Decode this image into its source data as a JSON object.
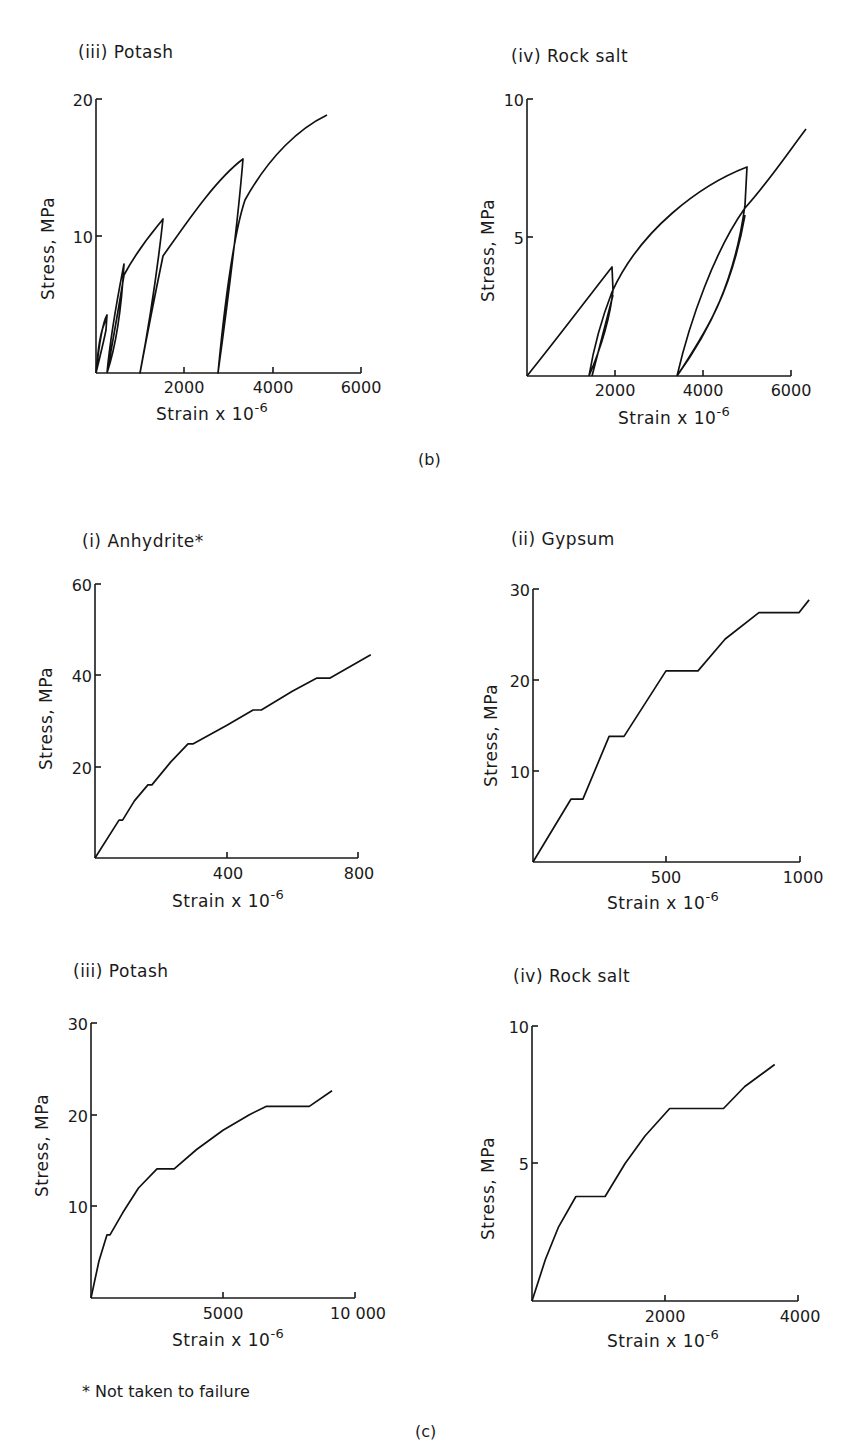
{
  "captions": {
    "b": "(b)",
    "c": "(c)"
  },
  "footnote": "* Not taken to failure",
  "axis_labels": {
    "y": "Stress, MPa",
    "x_prefix": "Strain x 10",
    "x_exp": "-6"
  },
  "chart_data": [
    {
      "id": "b-iii",
      "type": "line",
      "title": "(iii) Potash",
      "group": "(b)",
      "xlabel": "Strain x 10^-6",
      "ylabel": "Stress, MPa",
      "xlim": [
        0,
        6000
      ],
      "ylim": [
        0,
        20
      ],
      "xticks": [
        2000,
        4000,
        6000
      ],
      "yticks": [
        10,
        20
      ],
      "xticklabels": [
        "2000",
        "4000",
        "6000"
      ],
      "yticklabels": [
        "10",
        "20"
      ],
      "grid": false,
      "description": "Cyclic loading with hysteresis loops",
      "x": [
        0,
        120,
        250,
        180,
        60,
        0,
        260,
        450,
        630,
        560,
        260,
        600,
        1000,
        1520,
        1430,
        1010,
        1200,
        1600,
        2200,
        2800,
        3330,
        3250,
        2740,
        3000,
        3400,
        3800,
        4300,
        4800,
        5230
      ],
      "y": [
        0,
        2.5,
        4.2,
        3.0,
        1.0,
        0,
        0,
        4.5,
        8.0,
        6.5,
        0,
        5.0,
        7.8,
        11.2,
        9.5,
        0,
        5.0,
        9.2,
        12.0,
        14.0,
        15.6,
        12.8,
        0,
        7.0,
        13.0,
        15.8,
        17.3,
        18.2,
        18.8
      ],
      "peaks": [
        {
          "x": 250,
          "y": 4.2
        },
        {
          "x": 630,
          "y": 8.0
        },
        {
          "x": 1520,
          "y": 11.2
        },
        {
          "x": 3330,
          "y": 15.6
        },
        {
          "x": 5230,
          "y": 18.8
        }
      ],
      "unload_residual_strain": [
        0,
        260,
        1010,
        2740
      ]
    },
    {
      "id": "b-iv",
      "type": "line",
      "title": "(iv) Rock salt",
      "group": "(b)",
      "xlabel": "Strain x 10^-6",
      "ylabel": "Stress, MPa",
      "xlim": [
        0,
        6000
      ],
      "ylim": [
        0,
        10
      ],
      "xticks": [
        2000,
        4000,
        6000
      ],
      "yticks": [
        5,
        10
      ],
      "xticklabels": [
        "2000",
        "4000",
        "6000"
      ],
      "yticklabels": [
        "5",
        "10"
      ],
      "grid": false,
      "description": "Cyclic loading with hysteresis loops",
      "peaks": [
        {
          "x": 1930,
          "y": 3.9
        },
        {
          "x": 5000,
          "y": 7.55
        },
        {
          "x": 6340,
          "y": 8.9
        }
      ],
      "unload_residual_strain": [
        1410,
        3410
      ]
    },
    {
      "id": "c-i",
      "type": "line",
      "title": "(i) Anhydrite*",
      "group": "(c)",
      "xlabel": "Strain x 10^-6",
      "ylabel": "Stress, MPa",
      "xlim": [
        0,
        800
      ],
      "ylim": [
        0,
        60
      ],
      "xticks": [
        400,
        800
      ],
      "yticks": [
        20,
        40,
        60
      ],
      "xticklabels": [
        "400",
        "800"
      ],
      "yticklabels": [
        "20",
        "40",
        "60"
      ],
      "grid": false,
      "x": [
        0,
        73,
        84,
        120,
        161,
        173,
        230,
        283,
        299,
        400,
        481,
        506,
        600,
        675,
        715,
        839
      ],
      "y": [
        0,
        8.3,
        8.3,
        12.5,
        16,
        16,
        21,
        25,
        25,
        29,
        32.4,
        32.4,
        36.5,
        39.4,
        39.4,
        44.5
      ]
    },
    {
      "id": "c-ii",
      "type": "line",
      "title": "(ii) Gypsum",
      "group": "(c)",
      "xlabel": "Strain x 10^-6",
      "ylabel": "Stress, MPa",
      "xlim": [
        0,
        1000
      ],
      "ylim": [
        0,
        30
      ],
      "xticks": [
        500,
        1000
      ],
      "yticks": [
        10,
        20,
        30
      ],
      "xticklabels": [
        "500",
        "1000"
      ],
      "yticklabels": [
        "10",
        "20",
        "30"
      ],
      "grid": false,
      "x": [
        0,
        142,
        187,
        285,
        341,
        498,
        618,
        720,
        846,
        996,
        1034
      ],
      "y": [
        0,
        6.9,
        6.9,
        13.8,
        13.8,
        21,
        21,
        24.5,
        27.4,
        27.4,
        28.8
      ]
    },
    {
      "id": "c-iii",
      "type": "line",
      "title": "(iii) Potash",
      "group": "(c)",
      "xlabel": "Strain x 10^-6",
      "ylabel": "Stress, MPa",
      "xlim": [
        0,
        10000
      ],
      "ylim": [
        0,
        30
      ],
      "xticks": [
        5000,
        10000
      ],
      "yticks": [
        10,
        20,
        30
      ],
      "xticklabels": [
        "5000",
        "10 000"
      ],
      "yticklabels": [
        "10",
        "20",
        "30"
      ],
      "grid": false,
      "x": [
        0,
        300,
        606,
        720,
        1200,
        1800,
        2500,
        3150,
        4000,
        5000,
        6000,
        6630,
        8270,
        9130
      ],
      "y": [
        0,
        4.0,
        6.9,
        6.9,
        9.3,
        12.0,
        14.1,
        14.1,
        16.2,
        18.3,
        20.0,
        20.9,
        20.9,
        22.6
      ]
    },
    {
      "id": "c-iv",
      "type": "line",
      "title": "(iv) Rock salt",
      "group": "(c)",
      "xlabel": "Strain x 10^-6",
      "ylabel": "Stress, MPa",
      "xlim": [
        0,
        4000
      ],
      "ylim": [
        0,
        10
      ],
      "xticks": [
        2000,
        4000
      ],
      "yticks": [
        5,
        10
      ],
      "xticklabels": [
        "2000",
        "4000"
      ],
      "yticklabels": [
        "5",
        "10"
      ],
      "grid": false,
      "x": [
        0,
        200,
        400,
        660,
        1100,
        1400,
        1700,
        2070,
        2880,
        3200,
        3650
      ],
      "y": [
        0,
        1.5,
        2.7,
        3.8,
        3.8,
        5.0,
        6.0,
        7.0,
        7.0,
        7.8,
        8.6
      ]
    }
  ]
}
